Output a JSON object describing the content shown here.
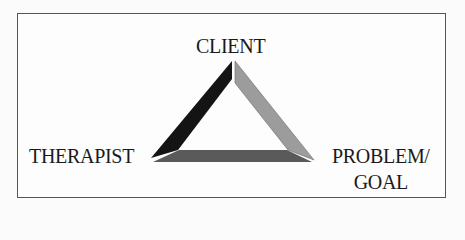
{
  "diagram": {
    "type": "triangle-relationship",
    "nodes": {
      "top": "CLIENT",
      "left": "THERAPIST",
      "right_line1": "PROBLEM/",
      "right_line2": "GOAL"
    },
    "colors": {
      "left_edge": "#141414",
      "right_edge": "#9a9a9a",
      "bottom_edge": "#5a5a5a",
      "border": "#555555"
    }
  }
}
